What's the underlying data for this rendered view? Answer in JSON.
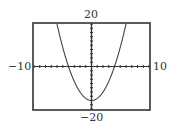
{
  "window": {
    "xmin": -10,
    "xmax": 10,
    "ymin": -20,
    "ymax": 20,
    "xscl": 1,
    "yscl": 2
  },
  "labels": {
    "ymax": "20",
    "ymin": "−20",
    "xmin": "−10",
    "xmax": "10"
  },
  "colors": {
    "frame": "#333333",
    "axis": "#333333",
    "curve": "#444444"
  },
  "chart_data": {
    "type": "line",
    "title": "",
    "xlabel": "",
    "ylabel": "",
    "function": "y = x^2 - 16",
    "xlim": [
      -10,
      10
    ],
    "ylim": [
      -20,
      20
    ],
    "grid": false,
    "legend": null,
    "tick_labels": {
      "x": [
        "−10",
        "10"
      ],
      "y": [
        "−20",
        "20"
      ]
    },
    "series": [
      {
        "name": "y = x^2 - 16",
        "x": [
          -6,
          -5,
          -4,
          -3,
          -2,
          -1,
          0,
          1,
          2,
          3,
          4,
          5,
          6
        ],
        "y": [
          20,
          9,
          0,
          -7,
          -12,
          -15,
          -16,
          -15,
          -12,
          -7,
          0,
          9,
          20
        ]
      }
    ],
    "key_points": {
      "vertex": [
        0,
        -16
      ],
      "x_intercepts": [
        -4,
        4
      ],
      "y_intercept": -16
    }
  }
}
